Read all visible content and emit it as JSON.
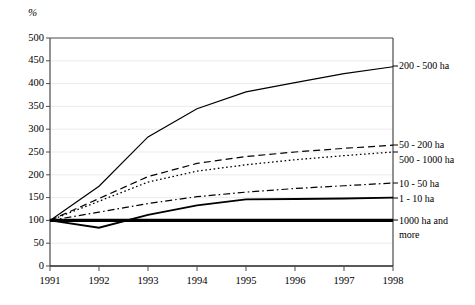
{
  "chart_data": {
    "type": "line",
    "title": "",
    "xlabel": "",
    "ylabel": "%",
    "x": [
      "1991",
      "1992",
      "1993",
      "1994",
      "1995",
      "1996",
      "1997",
      "1998"
    ],
    "ylim": [
      0,
      500
    ],
    "ytick_step": 50,
    "yticks": [
      "500",
      "450",
      "400",
      "350",
      "300",
      "250",
      "200",
      "150",
      "100",
      "50",
      "0"
    ],
    "grid": true,
    "legend_position": "right-inline",
    "series": [
      {
        "name": "200 - 500 ha",
        "style": "solid-thin",
        "values": [
          100,
          175,
          283,
          345,
          382,
          402,
          422,
          437
        ]
      },
      {
        "name": "50 - 200 ha",
        "style": "dashed",
        "values": [
          100,
          148,
          196,
          225,
          240,
          250,
          258,
          265
        ]
      },
      {
        "name": "500 - 1000 ha",
        "style": "dotted",
        "values": [
          100,
          142,
          184,
          208,
          222,
          233,
          242,
          250
        ]
      },
      {
        "name": "10 - 50 ha",
        "style": "dash-dot",
        "values": [
          100,
          118,
          137,
          152,
          162,
          170,
          176,
          182
        ]
      },
      {
        "name": "1 - 10 ha",
        "style": "solid-medium",
        "values": [
          100,
          84,
          112,
          133,
          146,
          147,
          148,
          150
        ]
      },
      {
        "name": "1000 ha and more",
        "style": "solid-thick",
        "values": [
          100,
          100,
          100,
          100,
          100,
          100,
          100,
          100
        ]
      }
    ]
  },
  "axis": {
    "unit_label": "%"
  },
  "legend_labels": {
    "s0": "200 - 500 ha",
    "s1": "50 - 200 ha",
    "s2": "500 - 1000 ha",
    "s3": "10 - 50 ha",
    "s4": "1 - 10 ha",
    "s5_line1": "1000 ha and",
    "s5_line2": "more"
  },
  "colors": {
    "line": "#000000",
    "axis": "#3a3a3a",
    "grid": "#e3e3e3",
    "background": "#ffffff"
  }
}
